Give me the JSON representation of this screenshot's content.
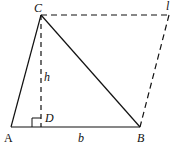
{
  "diagram": {
    "points": {
      "A": "A",
      "B": "B",
      "C": "C",
      "D": "D",
      "E": "l"
    },
    "segment_labels": {
      "height": "h",
      "base": "b"
    },
    "colors": {
      "stroke": "#111111",
      "background": "#ffffff"
    }
  }
}
